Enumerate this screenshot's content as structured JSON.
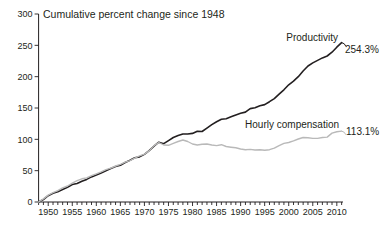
{
  "title": "Cumulative percent change since 1948",
  "colors": {
    "productivity_line": "#231f20",
    "compensation_line": "#b9b9b9",
    "axis": "#231f20",
    "text": "#231f20",
    "background": "#ffffff"
  },
  "annotations": {
    "productivity_label": "Productivity",
    "productivity_value": "254.3%",
    "compensation_label": "Hourly compensation",
    "compensation_value": "113.1%"
  },
  "chart_data": {
    "type": "line",
    "title": "Cumulative percent change since 1948",
    "xlabel": "",
    "ylabel": "",
    "xlim": [
      1948,
      2011
    ],
    "ylim": [
      0,
      300
    ],
    "grid": false,
    "legend_position": "end-of-line-labels",
    "y_ticks": [
      0,
      50,
      100,
      150,
      200,
      250,
      300
    ],
    "x_major_ticks": [
      1950,
      1955,
      1960,
      1965,
      1970,
      1975,
      1980,
      1985,
      1990,
      1995,
      2000,
      2005,
      2010
    ],
    "x_minor_tick_interval": 1,
    "x": [
      1948,
      1949,
      1950,
      1951,
      1952,
      1953,
      1954,
      1955,
      1956,
      1957,
      1958,
      1959,
      1960,
      1961,
      1962,
      1963,
      1964,
      1965,
      1966,
      1967,
      1968,
      1969,
      1970,
      1971,
      1972,
      1973,
      1974,
      1975,
      1976,
      1977,
      1978,
      1979,
      1980,
      1981,
      1982,
      1983,
      1984,
      1985,
      1986,
      1987,
      1988,
      1989,
      1990,
      1991,
      1992,
      1993,
      1994,
      1995,
      1996,
      1997,
      1998,
      1999,
      2000,
      2001,
      2002,
      2003,
      2004,
      2005,
      2006,
      2007,
      2008,
      2009,
      2010,
      2011
    ],
    "series": [
      {
        "name": "Productivity",
        "end_label": "254.3%",
        "color": "#231f20",
        "values": [
          0,
          4,
          10,
          14,
          16.5,
          20,
          23.5,
          28,
          29.5,
          33,
          36,
          40,
          43,
          46.5,
          50,
          53.5,
          56.5,
          58.5,
          63,
          66.5,
          70.5,
          72,
          76,
          82,
          89,
          95.5,
          93,
          98,
          103,
          106,
          108.5,
          108.5,
          109.5,
          113,
          112.5,
          118,
          123.5,
          128,
          132,
          133,
          136,
          139,
          141.5,
          143.5,
          149,
          150.5,
          153.5,
          155.5,
          160,
          165,
          172,
          179,
          187,
          193,
          200,
          209,
          217,
          222,
          226,
          230,
          233,
          239,
          247,
          254.3
        ]
      },
      {
        "name": "Hourly compensation",
        "end_label": "113.1%",
        "color": "#b9b9b9",
        "values": [
          0,
          5,
          11,
          15,
          18,
          22.5,
          25.5,
          30,
          34,
          37,
          38.5,
          42,
          45,
          48,
          51.5,
          54,
          57.5,
          60,
          63.5,
          66,
          70,
          73.5,
          76.5,
          81.5,
          90,
          95,
          91,
          90.5,
          93.5,
          96.5,
          99,
          96.5,
          92.5,
          91,
          92,
          92.5,
          91,
          90,
          91.5,
          88.5,
          87.5,
          86.5,
          84.5,
          83.5,
          84,
          83,
          83.5,
          82.5,
          83.5,
          86,
          90,
          93.5,
          95,
          97.5,
          100.5,
          103,
          102.5,
          101.5,
          101.5,
          103,
          103.5,
          110,
          112,
          113.1
        ]
      }
    ]
  }
}
